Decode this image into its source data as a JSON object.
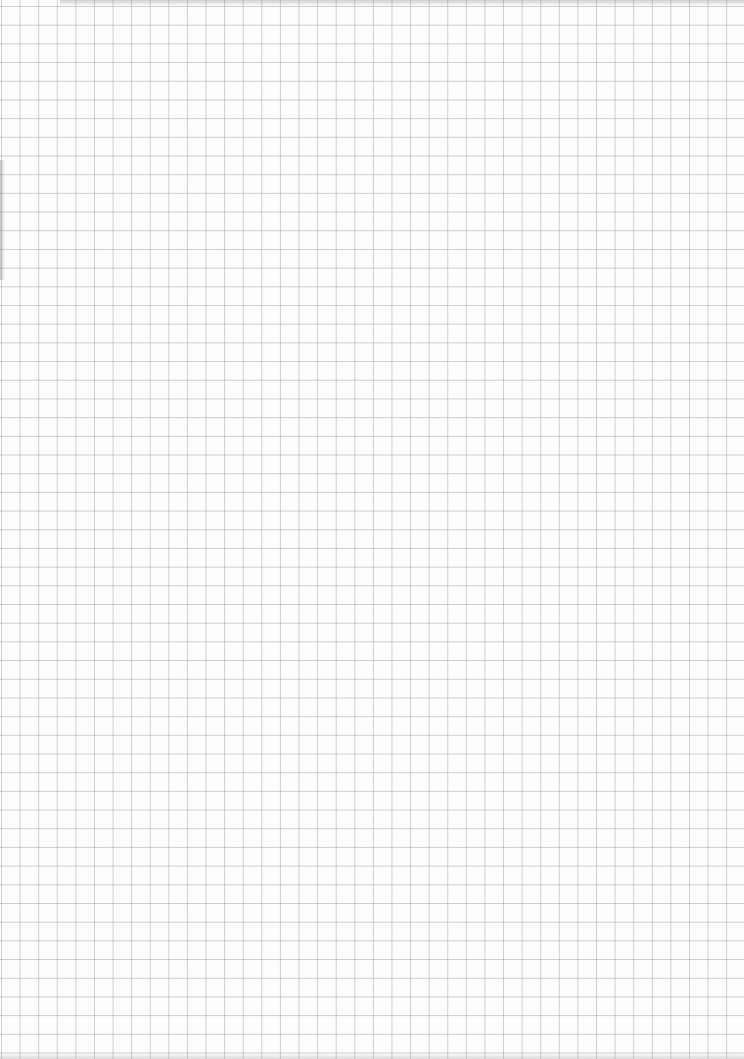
{
  "image": {
    "description": "Scanned sheet of blank square-grid graph paper",
    "grid": {
      "columns": 40,
      "rows": 57,
      "cell_size_px": 18.6,
      "line_color": "#969696",
      "paper_color": "#fdfdfd"
    }
  }
}
